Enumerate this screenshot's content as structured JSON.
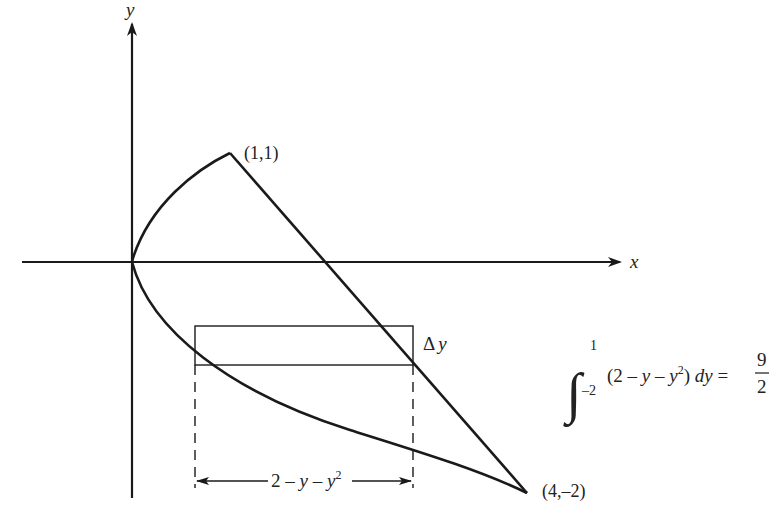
{
  "axes": {
    "x_label": "x",
    "y_label": "y"
  },
  "points": {
    "top": "(1,1)",
    "bottom": "(4,–2)"
  },
  "strip": {
    "thickness_label_delta": "Δ",
    "thickness_label_var": "y",
    "width_label_main": "2 – y – y",
    "width_label_exp": "2"
  },
  "integral": {
    "upper": "1",
    "lower": "–2",
    "integrand_open": "(2 – ",
    "integrand_y1": "y",
    "integrand_mid": " – ",
    "integrand_y2": "y",
    "integrand_exp": "2",
    "integrand_close": ")",
    "differential": "dy",
    "equals": "=",
    "numerator": "9",
    "denominator": "2"
  },
  "colors": {
    "ink": "#1a1a1a"
  }
}
